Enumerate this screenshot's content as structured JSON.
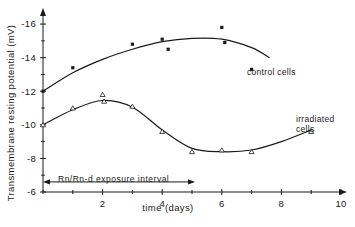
{
  "chart_data": {
    "type": "line",
    "title": "",
    "xlabel": "time  (days)",
    "ylabel": "Transmembrane  resting  potential  (mV)",
    "xlim": [
      0,
      10
    ],
    "ylim": [
      -6,
      -16.6
    ],
    "xticks": [
      0,
      1,
      2,
      3,
      4,
      5,
      6,
      7,
      8,
      9,
      10
    ],
    "xticklabels": [
      "",
      "",
      "2",
      "",
      "4",
      "",
      "6",
      "",
      "8",
      "",
      "10"
    ],
    "yticks": [
      -6,
      -7,
      -8,
      -9,
      -10,
      -11,
      -12,
      -13,
      -14,
      -15,
      -16
    ],
    "yticklabels": [
      "-6",
      "",
      "-8",
      "",
      "-10",
      "",
      "-12",
      "",
      "-14",
      "",
      "-16"
    ],
    "grid": false,
    "legend_position": "inline-annotations",
    "series": [
      {
        "name": "control cells",
        "marker": "filled-square",
        "label": "control  cells",
        "points": [
          {
            "x": 0.0,
            "y": -12.0
          },
          {
            "x": 1.0,
            "y": -13.4
          },
          {
            "x": 3.0,
            "y": -14.8
          },
          {
            "x": 4.0,
            "y": -15.1
          },
          {
            "x": 4.2,
            "y": -14.5
          },
          {
            "x": 6.0,
            "y": -15.8
          },
          {
            "x": 6.1,
            "y": -14.9
          },
          {
            "x": 7.0,
            "y": -13.3
          }
        ],
        "curve": [
          {
            "x": 0.0,
            "y": -12.0
          },
          {
            "x": 1.0,
            "y": -13.1
          },
          {
            "x": 2.0,
            "y": -13.9
          },
          {
            "x": 3.0,
            "y": -14.5
          },
          {
            "x": 4.0,
            "y": -14.95
          },
          {
            "x": 5.0,
            "y": -15.15
          },
          {
            "x": 6.0,
            "y": -15.1
          },
          {
            "x": 7.0,
            "y": -14.6
          },
          {
            "x": 7.6,
            "y": -14.0
          }
        ]
      },
      {
        "name": "irradiated cells",
        "marker": "open-triangle",
        "label": "irradiated\ncells",
        "label_line1": "irradiated",
        "label_line2": "cells",
        "points": [
          {
            "x": 0.0,
            "y": -10.0
          },
          {
            "x": 1.0,
            "y": -11.0
          },
          {
            "x": 2.0,
            "y": -11.8
          },
          {
            "x": 2.05,
            "y": -11.4
          },
          {
            "x": 3.0,
            "y": -11.1
          },
          {
            "x": 4.0,
            "y": -9.6
          },
          {
            "x": 5.0,
            "y": -8.4
          },
          {
            "x": 6.0,
            "y": -8.5
          },
          {
            "x": 7.0,
            "y": -8.4
          },
          {
            "x": 9.0,
            "y": -9.6
          }
        ],
        "curve": [
          {
            "x": 0.0,
            "y": -10.0
          },
          {
            "x": 1.0,
            "y": -10.9
          },
          {
            "x": 2.0,
            "y": -11.45
          },
          {
            "x": 3.0,
            "y": -11.05
          },
          {
            "x": 4.0,
            "y": -9.7
          },
          {
            "x": 5.0,
            "y": -8.6
          },
          {
            "x": 6.0,
            "y": -8.4
          },
          {
            "x": 7.0,
            "y": -8.5
          },
          {
            "x": 8.0,
            "y": -9.0
          },
          {
            "x": 9.0,
            "y": -9.7
          }
        ]
      }
    ],
    "annotations": [
      {
        "name": "exposure-interval",
        "text": "Rn/Rn-d  exposure  interval",
        "arrow_from_x": 0.0,
        "arrow_to_x": 5.1,
        "arrow_y": -6.6,
        "double_headed": true
      }
    ]
  }
}
